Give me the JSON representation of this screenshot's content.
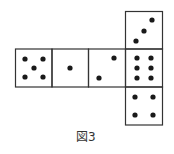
{
  "figure": {
    "caption": "図3",
    "line_color": "#333333",
    "dot_color": "#1a1a1a"
  },
  "faces": [
    {
      "id": "top",
      "label": "3 dots diagonal",
      "count": 3
    },
    {
      "id": "row-1",
      "label": "5 dots",
      "count": 5
    },
    {
      "id": "row-2",
      "label": "1 dot",
      "count": 1
    },
    {
      "id": "row-3",
      "label": "2 dots diagonal",
      "count": 2
    },
    {
      "id": "row-4",
      "label": "6 dots",
      "count": 6
    },
    {
      "id": "bottom",
      "label": "4 dots",
      "count": 4
    }
  ]
}
